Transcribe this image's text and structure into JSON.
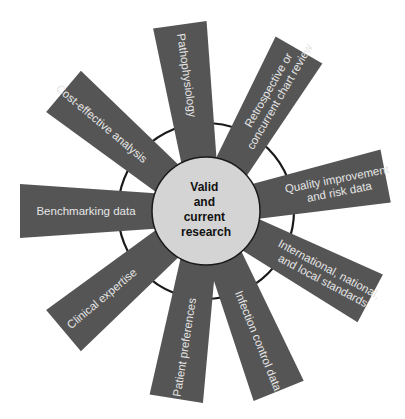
{
  "diagram": {
    "center": {
      "lines": [
        "Valid",
        "and",
        "current",
        "research"
      ]
    },
    "blades": [
      {
        "id": "pathophysiology",
        "angle": -98,
        "length": 188,
        "lines": [
          "Pathophysiology"
        ]
      },
      {
        "id": "retrospective",
        "angle": -60,
        "length": 186,
        "lines": [
          "Retrospective or",
          "concurrent chart review"
        ]
      },
      {
        "id": "quality",
        "angle": -11,
        "length": 183,
        "lines": [
          "Quality improvement",
          "and risk data"
        ]
      },
      {
        "id": "international",
        "angle": 28,
        "length": 186,
        "lines": [
          "International, national,",
          "and local standards"
        ]
      },
      {
        "id": "infection",
        "angle": 68,
        "length": 194,
        "lines": [
          "Infection control data"
        ]
      },
      {
        "id": "patient",
        "angle": 99,
        "length": 190,
        "lines": [
          "Patient preferences"
        ]
      },
      {
        "id": "clinical",
        "angle": 140,
        "length": 186,
        "lines": [
          "Clinical expertise"
        ]
      },
      {
        "id": "benchmarking",
        "angle": 180,
        "length": 186,
        "lines": [
          "Benchmarking data"
        ]
      },
      {
        "id": "cost",
        "angle": -140,
        "length": 186,
        "lines": [
          "Cost-effective analysis"
        ]
      }
    ],
    "colors": {
      "blade": "#555555",
      "blade_text": "#e6e6e6",
      "hub": "#d4d4d4",
      "ring": "#1a1a1a",
      "center_text": "#111111"
    }
  }
}
